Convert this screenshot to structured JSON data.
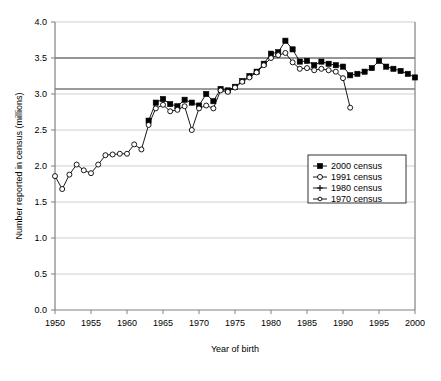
{
  "chart_data": {
    "type": "line",
    "title": "",
    "xlabel": "Year of birth",
    "ylabel": "Number reported in census (millions)",
    "xlim": [
      1950,
      2000
    ],
    "ylim": [
      0.0,
      4.0
    ],
    "xticks": [
      1950,
      1955,
      1960,
      1965,
      1970,
      1975,
      1980,
      1985,
      1990,
      1995,
      2000
    ],
    "yticks": [
      0.0,
      0.5,
      1.0,
      1.5,
      2.0,
      2.5,
      3.0,
      3.5,
      4.0
    ],
    "ytick_labels": [
      "0.0",
      "0.5",
      "1.0",
      "1.5",
      "2.0",
      "2.5",
      "3.0",
      "3.5",
      "4.0"
    ],
    "xtick_labels": [
      "1950",
      "1955",
      "1960",
      "1965",
      "1970",
      "1975",
      "1980",
      "1985",
      "1990",
      "1995",
      "2000"
    ],
    "grid": true,
    "grid_axis": "y",
    "legend_position": "center-right",
    "reference_lines": [
      3.07,
      3.5
    ],
    "series": [
      {
        "name": "2000 census",
        "marker": "filled-square",
        "color": "#000000",
        "x": [
          1963,
          1964,
          1965,
          1966,
          1967,
          1968,
          1969,
          1970,
          1971,
          1972,
          1973,
          1974,
          1975,
          1976,
          1977,
          1978,
          1979,
          1980,
          1981,
          1982,
          1983,
          1984,
          1985,
          1986,
          1987,
          1988,
          1989,
          1990,
          1991,
          1992,
          1993,
          1994,
          1995,
          1996,
          1997,
          1998,
          1999,
          2000
        ],
        "values": [
          2.63,
          2.88,
          2.93,
          2.86,
          2.83,
          2.92,
          2.88,
          2.84,
          3.0,
          2.9,
          3.07,
          3.05,
          3.1,
          3.18,
          3.25,
          3.31,
          3.42,
          3.56,
          3.58,
          3.74,
          3.62,
          3.45,
          3.46,
          3.4,
          3.45,
          3.42,
          3.4,
          3.38,
          3.26,
          3.28,
          3.31,
          3.36,
          3.46,
          3.38,
          3.35,
          3.32,
          3.28,
          3.23
        ]
      },
      {
        "name": "1991 census",
        "marker": "open-circle",
        "color": "#000000",
        "x": [
          1950,
          1951,
          1952,
          1953,
          1954,
          1955,
          1956,
          1957,
          1958,
          1959,
          1960,
          1961,
          1962,
          1963,
          1964,
          1965,
          1966,
          1967,
          1968,
          1969,
          1970,
          1971,
          1972,
          1973,
          1974,
          1975,
          1976,
          1977,
          1978,
          1979,
          1980,
          1981,
          1982,
          1983,
          1984,
          1985,
          1986,
          1987,
          1988,
          1989,
          1990,
          1991
        ],
        "values": [
          1.86,
          1.68,
          1.88,
          2.02,
          1.94,
          1.9,
          2.02,
          2.15,
          2.16,
          2.17,
          2.17,
          2.3,
          2.23,
          2.57,
          2.8,
          2.85,
          2.76,
          2.78,
          2.83,
          2.5,
          2.8,
          2.84,
          2.8,
          3.05,
          3.03,
          3.09,
          3.17,
          3.23,
          3.3,
          3.4,
          3.5,
          3.54,
          3.57,
          3.44,
          3.35,
          3.36,
          3.33,
          3.35,
          3.33,
          3.31,
          3.22,
          2.81
        ]
      },
      {
        "name": "1980 census",
        "marker": "plus-cross",
        "color": "#000000",
        "x": [],
        "values": []
      },
      {
        "name": "1970 census",
        "marker": "open-circle-small",
        "color": "#000000",
        "x": [],
        "values": []
      }
    ],
    "legend_entries": [
      {
        "label": "2000 census",
        "marker": "filled-square"
      },
      {
        "label": "1991 census",
        "marker": "open-circle"
      },
      {
        "label": "1980 census",
        "marker": "plus-cross"
      },
      {
        "label": "1970 census",
        "marker": "open-circle-small"
      }
    ]
  }
}
